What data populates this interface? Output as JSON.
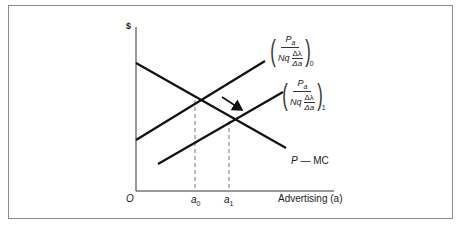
{
  "diagram": {
    "type": "economics-advertising-equilibrium",
    "y_axis_label": "$",
    "x_axis_label": "Advertising (a)",
    "origin_label": "O",
    "x_ticks": [
      {
        "label": "a",
        "sub": "0"
      },
      {
        "label": "a",
        "sub": "1"
      }
    ],
    "curves": [
      {
        "name": "P − MC",
        "label_main": "P",
        "label_rest": " — MC",
        "slope": "downward"
      },
      {
        "name": "marginal benefit 0",
        "numerator": "P",
        "numerator_sub": "a",
        "denominator_prefix": "Nq",
        "inner_numerator": "Δλ",
        "inner_denominator": "Δa",
        "subscript": "0",
        "slope": "upward"
      },
      {
        "name": "marginal benefit 1",
        "numerator": "P",
        "numerator_sub": "a",
        "denominator_prefix": "Nq",
        "inner_numerator": "Δλ",
        "inner_denominator": "Δa",
        "subscript": "1",
        "slope": "upward"
      }
    ],
    "shift_arrow": "rightward shift from curve 0 to curve 1",
    "colors": {
      "line": "#111111",
      "frame": "#8a8a8a",
      "dashed": "#555555"
    }
  }
}
